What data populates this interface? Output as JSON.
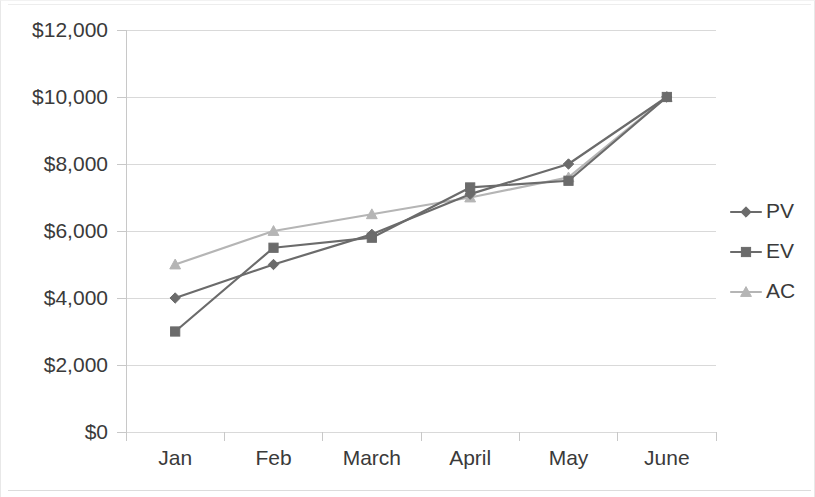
{
  "chart_data": {
    "type": "line",
    "title": "",
    "subtitle": "",
    "xlabel": "",
    "ylabel": "",
    "categories": [
      "Jan",
      "Feb",
      "March",
      "April",
      "May",
      "June"
    ],
    "series": [
      {
        "name": "PV",
        "values": [
          4000,
          5000,
          5900,
          7100,
          8000,
          10000
        ],
        "color": "#6b6b6b",
        "marker": "diamond"
      },
      {
        "name": "EV",
        "values": [
          3000,
          5500,
          5800,
          7300,
          7500,
          10000
        ],
        "color": "#6b6b6b",
        "marker": "square"
      },
      {
        "name": "AC",
        "values": [
          5000,
          6000,
          6500,
          7000,
          7600,
          10000
        ],
        "color": "#b5b5b5",
        "marker": "triangle"
      }
    ],
    "ylim": [
      0,
      12000
    ],
    "ytick_values": [
      0,
      2000,
      4000,
      6000,
      8000,
      10000,
      12000
    ],
    "ytick_labels": [
      "$0",
      "$2,000",
      "$4,000",
      "$6,000",
      "$8,000",
      "$10,000",
      "$12,000"
    ],
    "grid": true,
    "grid_axis": "y",
    "legend_position": "right",
    "legend_entries": [
      "PV",
      "EV",
      "AC"
    ]
  },
  "legend": {
    "items": [
      {
        "label": "PV"
      },
      {
        "label": "EV"
      },
      {
        "label": "AC"
      }
    ]
  },
  "colors": {
    "series_dark": "#6b6b6b",
    "series_light": "#b5b5b5",
    "gridline": "#d9d9d9",
    "axis": "#c8c8c8",
    "text": "#3a3a3a",
    "background": "#ffffff"
  }
}
